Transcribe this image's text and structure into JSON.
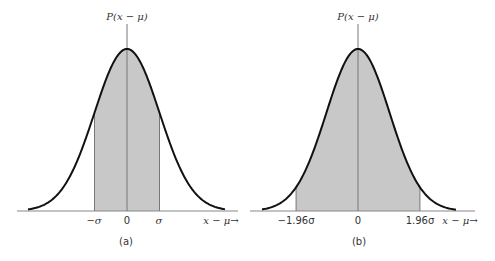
{
  "chart_data": [
    {
      "type": "area",
      "panel_label": "(a)",
      "title": "",
      "ylabel": "P(x − μ)",
      "xlabel": "x − μ→",
      "tick_labels": [
        "−σ",
        "0",
        "σ"
      ],
      "tick_positions_sigma": [
        -1,
        0,
        1
      ],
      "shaded_region_sigma": [
        -1,
        1
      ],
      "curve": "normal distribution",
      "grid": false
    },
    {
      "type": "area",
      "panel_label": "(b)",
      "title": "",
      "ylabel": "P(x − μ)",
      "xlabel": "x − μ→",
      "tick_labels": [
        "−1.96σ",
        "0",
        "1.96σ"
      ],
      "tick_positions_sigma": [
        -1.96,
        0,
        1.96
      ],
      "shaded_region_sigma": [
        -1.96,
        1.96
      ],
      "curve": "normal distribution",
      "grid": false
    }
  ],
  "colors": {
    "fill": "#c8c8c8",
    "curve": "#111111",
    "axis": "#777777"
  }
}
